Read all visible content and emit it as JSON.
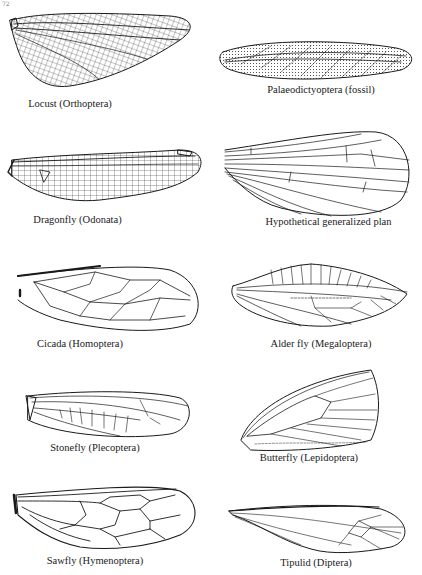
{
  "page": {
    "number": "72"
  },
  "figure": {
    "panels": [
      {
        "id": "locust",
        "caption": "Locust (Orthoptera)",
        "column": "left",
        "row": 1
      },
      {
        "id": "palaeodictyoptera",
        "caption": "Palaeodictyoptera (fossil)",
        "column": "right",
        "row": 1
      },
      {
        "id": "dragonfly",
        "caption": "Dragonfly (Odonata)",
        "column": "left",
        "row": 2
      },
      {
        "id": "hypothetical",
        "caption": "Hypothetical generalized plan",
        "column": "right",
        "row": 2
      },
      {
        "id": "cicada",
        "caption": "Cicada (Homoptera)",
        "column": "left",
        "row": 3
      },
      {
        "id": "alder-fly",
        "caption": "Alder fly (Megaloptera)",
        "column": "right",
        "row": 3
      },
      {
        "id": "stonefly",
        "caption": "Stonefly (Plecoptera)",
        "column": "left",
        "row": 4
      },
      {
        "id": "butterfly",
        "caption": "Butterfly (Lepidoptera)",
        "column": "right",
        "row": 4
      },
      {
        "id": "sawfly",
        "caption": "Sawfly (Hymenoptera)",
        "column": "left",
        "row": 5
      },
      {
        "id": "tipulid",
        "caption": "Tipulid (Diptera)",
        "column": "right",
        "row": 5
      }
    ]
  }
}
